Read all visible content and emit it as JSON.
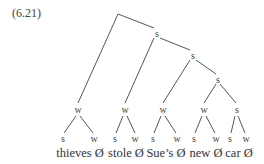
{
  "example_number": "(6.21)",
  "tree": {
    "nodes": {
      "s1": "s",
      "s2": "s",
      "s3": "s",
      "s4": "s",
      "w1": "w",
      "w2": "w",
      "w3": "w",
      "w4": "w"
    },
    "leaves": [
      {
        "left": "s",
        "right": "w",
        "word": "thieves Ø"
      },
      {
        "left": "s",
        "right": "w",
        "word": "stole Ø"
      },
      {
        "left": "s",
        "right": "w",
        "word": "Sue’s Ø"
      },
      {
        "left": "s",
        "right": "w",
        "word": "new Ø"
      },
      {
        "left": "s",
        "right": "w",
        "word": "car Ø"
      }
    ]
  }
}
